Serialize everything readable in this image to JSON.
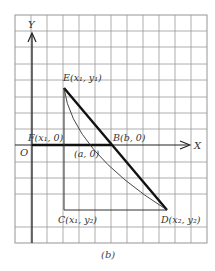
{
  "figure": {
    "caption": "(b)",
    "axes": {
      "x_label": "X",
      "y_label": "Y",
      "origin_label": "O"
    },
    "points": {
      "E": {
        "label": "E(x₁, y₁)"
      },
      "F": {
        "label": "F(x₁, 0)"
      },
      "A": {
        "label": "(a, 0)"
      },
      "B": {
        "label": "B(b, 0)"
      },
      "C": {
        "label": "C(x₁, y₂)"
      },
      "D": {
        "label": "D(x₂, y₂)"
      }
    },
    "grid": {
      "columns": 12,
      "rows": 14
    },
    "colors": {
      "line": "#222222",
      "grid": "#9a9a9a",
      "background": "#ffffff"
    }
  }
}
